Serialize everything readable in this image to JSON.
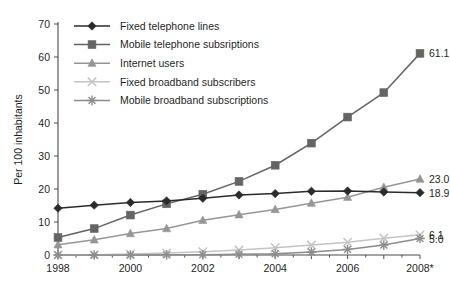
{
  "chart_data": {
    "type": "line",
    "title": "",
    "xlabel": "",
    "ylabel": "Per 100 inhabitants",
    "xlim": [
      1998,
      2008
    ],
    "ylim": [
      0,
      70
    ],
    "ytick_step": 10,
    "yticks": [
      0,
      10,
      20,
      30,
      40,
      50,
      60,
      70
    ],
    "x": [
      1998,
      1999,
      2000,
      2001,
      2002,
      2003,
      2004,
      2005,
      2006,
      2007,
      2008
    ],
    "xticks_labeled": [
      "1998",
      "2000",
      "2002",
      "2004",
      "2006",
      "2008*"
    ],
    "xticks_labeled_values": [
      1998,
      2000,
      2002,
      2004,
      2006,
      2008
    ],
    "grid": false,
    "legend_position": "top-left",
    "footnote_marker": "*",
    "series": [
      {
        "name": "Fixed telephone lines",
        "marker": "diamond",
        "color": "#2b2b2b",
        "values": [
          14.2,
          15.1,
          15.9,
          16.4,
          17.2,
          18.2,
          18.6,
          19.3,
          19.4,
          19.1,
          18.9
        ],
        "end_label": "18.9"
      },
      {
        "name": "Mobile telephone subsriptions",
        "marker": "square",
        "color": "#646464",
        "values": [
          5.3,
          8.0,
          12.1,
          15.5,
          18.4,
          22.3,
          27.2,
          33.9,
          41.8,
          49.2,
          61.1
        ],
        "end_label": "61.1"
      },
      {
        "name": "Internet users",
        "marker": "triangle",
        "color": "#969696",
        "values": [
          3.1,
          4.6,
          6.5,
          8.0,
          10.5,
          12.2,
          13.8,
          15.7,
          17.5,
          20.5,
          23.0
        ],
        "end_label": "23.0"
      },
      {
        "name": "Fixed broadband subscribers",
        "marker": "x",
        "color": "#c4c4c4",
        "values": [
          0.0,
          0.1,
          0.3,
          0.6,
          1.0,
          1.5,
          2.2,
          3.0,
          3.9,
          5.1,
          6.1
        ],
        "end_label": "6.1"
      },
      {
        "name": "Mobile broadband subscriptions",
        "marker": "asterisk",
        "color": "#8c8c8c",
        "values": [
          0.0,
          0.0,
          0.0,
          0.05,
          0.1,
          0.2,
          0.4,
          0.9,
          1.7,
          3.0,
          5.0
        ],
        "end_label": "5.0"
      }
    ]
  }
}
